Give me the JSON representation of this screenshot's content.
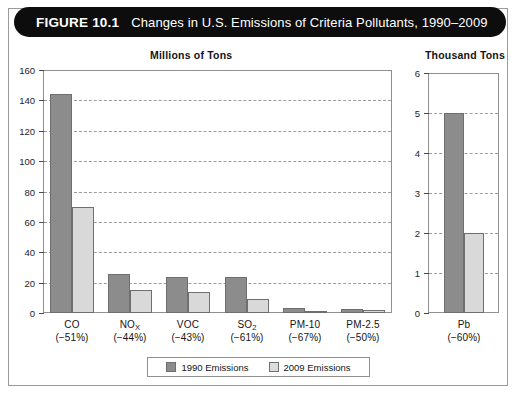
{
  "figure": {
    "number_label": "FIGURE 10.1",
    "title": "Changes in U.S. Emissions of Criteria Pollutants, 1990–2009"
  },
  "legend": {
    "items": [
      {
        "label": "1990 Emissions",
        "color": "#8c8c8c"
      },
      {
        "label": "2009 Emissions",
        "color": "#dcdcdc"
      }
    ]
  },
  "chart_data": [
    {
      "type": "bar",
      "panel": "main",
      "title": "Millions of Tons",
      "xlabel": "",
      "ylabel": "",
      "ylim": [
        0,
        160
      ],
      "yticks": [
        0,
        20,
        40,
        60,
        80,
        100,
        120,
        140,
        160
      ],
      "grid": true,
      "legend_position": "bottom",
      "categories": [
        "CO",
        "NOX",
        "VOC",
        "SO2",
        "PM-10",
        "PM-2.5"
      ],
      "category_labels": [
        "CO",
        "NO",
        "VOC",
        "SO",
        "PM-10",
        "PM-2.5"
      ],
      "category_subscripts": [
        "",
        "X",
        "",
        "2",
        "",
        ""
      ],
      "change_labels": [
        "(−51%)",
        "(−44%)",
        "(−43%)",
        "(−61%)",
        "(−67%)",
        "(−50%)"
      ],
      "series": [
        {
          "name": "1990 Emissions",
          "values": [
            144,
            25.5,
            23.5,
            23.5,
            3.5,
            2.5
          ]
        },
        {
          "name": "2009 Emissions",
          "values": [
            70,
            15,
            13.5,
            9.5,
            1.0,
            1.8
          ]
        }
      ]
    },
    {
      "type": "bar",
      "panel": "right",
      "title": "Thousand Tons",
      "xlabel": "",
      "ylabel": "",
      "ylim": [
        0,
        6
      ],
      "yticks": [
        0,
        1,
        2,
        3,
        4,
        5,
        6
      ],
      "grid": true,
      "legend_position": "bottom",
      "categories": [
        "Pb"
      ],
      "category_labels": [
        "Pb"
      ],
      "category_subscripts": [
        ""
      ],
      "change_labels": [
        "(−60%)"
      ],
      "series": [
        {
          "name": "1990 Emissions",
          "values": [
            5
          ]
        },
        {
          "name": "2009 Emissions",
          "values": [
            2
          ]
        }
      ]
    }
  ]
}
